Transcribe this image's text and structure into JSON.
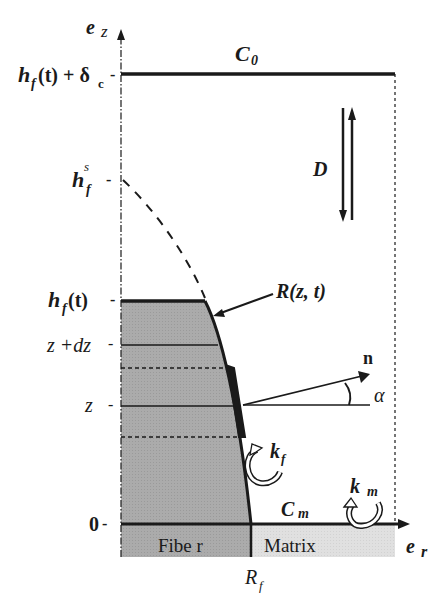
{
  "figure": {
    "axes": {
      "vertical_axis_label": "e",
      "vertical_axis_sub": "z",
      "horizontal_axis_label": "e",
      "horizontal_axis_sub": "r"
    },
    "tick_labels": {
      "top_main": "h",
      "top_sub": "f",
      "top_rest": "(t) + δ",
      "top_rest_sub": "c",
      "hfs_main": "h",
      "hfs_sub": "f",
      "hfs_sup": "s",
      "hft_main": "h",
      "hft_sub": "f",
      "hft_rest": " (t)",
      "zdz": "z +dz",
      "z": "z",
      "zero": "0",
      "tick_mark": "-"
    },
    "labels": {
      "c0_main": "C",
      "c0_sub": "0",
      "diffusion": "D",
      "interface": "R(z, t)",
      "normal": "n",
      "angle": "α",
      "kf_main": "k",
      "kf_sub": "f",
      "km_main": "k",
      "km_sub": "m",
      "cm_main": "C",
      "cm_sub": "m",
      "fiber": "Fibe r",
      "matrix": "Matrix",
      "rf_main": "R",
      "rf_sub": "f"
    },
    "colors": {
      "ink": "#1a1a1a",
      "fiber_fill": "#a9a9a9",
      "matrix_fill": "#dedede",
      "background": "#ffffff"
    }
  }
}
